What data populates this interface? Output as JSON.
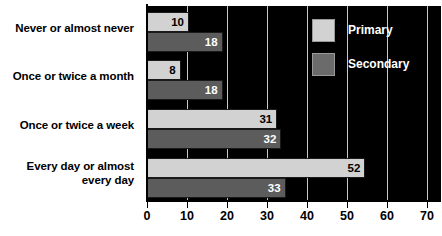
{
  "chart_data": {
    "type": "bar",
    "orientation": "horizontal",
    "title": "",
    "xlabel": "",
    "ylabel": "",
    "xlim": [
      0,
      70
    ],
    "xticks": [
      0,
      10,
      20,
      30,
      40,
      50,
      60,
      70
    ],
    "grid": true,
    "legend_position": "top-right-inside",
    "categories": [
      "Never or almost never",
      "Once or twice a month",
      "Once or twice a week",
      "Every day or almost every day"
    ],
    "series": [
      {
        "name": "Primary",
        "color": "#d2d2d2",
        "values": [
          10,
          8,
          31,
          52
        ]
      },
      {
        "name": "Secondary",
        "color": "#5c5c5c",
        "values": [
          18,
          18,
          32,
          33
        ]
      }
    ]
  },
  "category_labels": [
    {
      "line1": "Never or almost never",
      "line2": ""
    },
    {
      "line1": "Once or twice a month",
      "line2": ""
    },
    {
      "line1": "Once or twice a week",
      "line2": ""
    },
    {
      "line1": "Every day or almost",
      "line2": "every day"
    }
  ],
  "bar_values": {
    "g0p": "10",
    "g0s": "18",
    "g1p": "8",
    "g1s": "18",
    "g2p": "31",
    "g2s": "32",
    "g3p": "52",
    "g3s": "33"
  },
  "xticks": {
    "t0": "0",
    "t1": "10",
    "t2": "20",
    "t3": "30",
    "t4": "40",
    "t5": "50",
    "t6": "60",
    "t7": "70"
  },
  "legend": {
    "primary_label": "Primary",
    "secondary_label": "Secondary"
  },
  "colors": {
    "primary": "#d2d2d2",
    "secondary": "#5c5c5c",
    "plot_background": "#000000",
    "gridline": "#c9c9c9",
    "page_background": "#ffffff"
  }
}
